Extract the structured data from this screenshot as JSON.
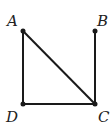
{
  "diagram": {
    "points": [
      {
        "name": "A",
        "x": 23,
        "y": 31
      },
      {
        "name": "B",
        "x": 95,
        "y": 31
      },
      {
        "name": "C",
        "x": 95,
        "y": 104
      },
      {
        "name": "D",
        "x": 23,
        "y": 104
      }
    ],
    "segments": [
      [
        "A",
        "D"
      ],
      [
        "A",
        "C"
      ],
      [
        "D",
        "C"
      ],
      [
        "B",
        "C"
      ]
    ],
    "labels": {
      "A": "A",
      "B": "B",
      "C": "C",
      "D": "D"
    },
    "color": "#1a1a1a"
  }
}
